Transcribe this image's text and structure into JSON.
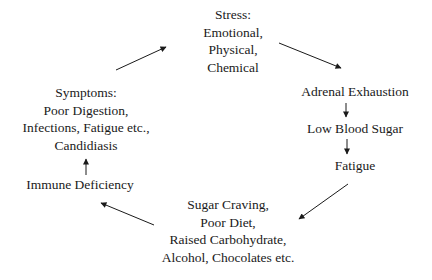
{
  "diagram": {
    "type": "cycle",
    "nodes": [
      {
        "id": "stress",
        "lines": [
          "Stress:",
          "Emotional,",
          "Physical,",
          "Chemical"
        ]
      },
      {
        "id": "adrenal",
        "lines": [
          "Adrenal Exhaustion"
        ]
      },
      {
        "id": "low-blood-sugar",
        "lines": [
          "Low Blood Sugar"
        ]
      },
      {
        "id": "fatigue",
        "lines": [
          "Fatigue"
        ]
      },
      {
        "id": "sugar-craving",
        "lines": [
          "Sugar Craving,",
          "Poor Diet,",
          "Raised Carbohydrate,",
          "Alcohol, Chocolates etc."
        ]
      },
      {
        "id": "immune",
        "lines": [
          "Immune Deficiency"
        ]
      },
      {
        "id": "symptoms",
        "lines": [
          "Symptoms:",
          "Poor Digestion,",
          "Infections, Fatigue etc.,",
          "Candidiasis"
        ]
      }
    ],
    "edges": [
      {
        "from": "stress",
        "to": "adrenal"
      },
      {
        "from": "adrenal",
        "to": "low-blood-sugar"
      },
      {
        "from": "low-blood-sugar",
        "to": "fatigue"
      },
      {
        "from": "fatigue",
        "to": "sugar-craving"
      },
      {
        "from": "sugar-craving",
        "to": "immune"
      },
      {
        "from": "immune",
        "to": "symptoms"
      },
      {
        "from": "symptoms",
        "to": "stress"
      }
    ]
  }
}
